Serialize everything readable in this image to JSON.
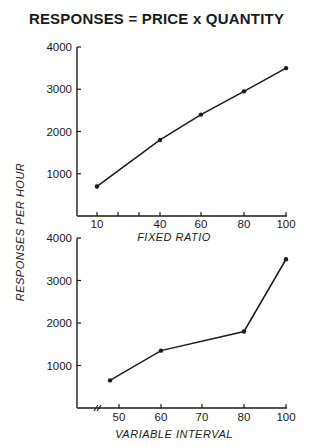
{
  "title": "RESPONSES = PRICE  x  QUANTITY",
  "ylabel": "RESPONSES  PER  HOUR",
  "chart_data": [
    {
      "type": "line",
      "title": "RESPONSES = PRICE x QUANTITY",
      "xlabel": "FIXED  RATIO",
      "ylabel": "RESPONSES PER HOUR",
      "x": [
        10,
        40,
        60,
        80,
        100
      ],
      "values": [
        700,
        1800,
        2400,
        2950,
        3500
      ],
      "xticks": [
        10,
        20,
        30,
        40,
        60,
        80,
        100
      ],
      "xtick_labels": [
        "10",
        "",
        "",
        "40",
        "60",
        "80",
        "100"
      ],
      "yticks": [
        1000,
        2000,
        3000,
        4000
      ],
      "ytick_labels": [
        "1000",
        "2000",
        "3000",
        "4000"
      ],
      "ylim": [
        0,
        4000
      ],
      "grid": false,
      "markers": true
    },
    {
      "type": "line",
      "xlabel": "VARIABLE  INTERVAL",
      "ylabel": "RESPONSES PER HOUR",
      "x": [
        47,
        60,
        80,
        100
      ],
      "values": [
        650,
        1350,
        1800,
        3500
      ],
      "xticks": [
        50,
        60,
        70,
        80,
        100
      ],
      "xtick_labels": [
        "50",
        "60",
        "70",
        "80",
        "100"
      ],
      "axis_break": true,
      "yticks": [
        1000,
        2000,
        3000,
        4000
      ],
      "ytick_labels": [
        "1000",
        "2000",
        "3000",
        "4000"
      ],
      "ylim": [
        0,
        4000
      ],
      "grid": false,
      "markers": true
    }
  ]
}
